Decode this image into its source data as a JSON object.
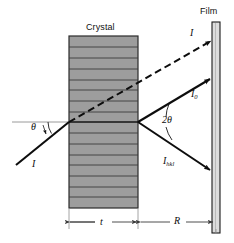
{
  "figure": {
    "type": "x-ray-diffraction-schematic",
    "labels": {
      "crystal": "Crystal",
      "film": "Film",
      "incident_beam": "I",
      "transmitted_beam": "I",
      "direct_beam": "I",
      "direct_beam_sub": "0",
      "diffracted_beam": "I",
      "diffracted_beam_sub": "hkl",
      "theta": "θ",
      "two_theta": "2θ",
      "thickness": "t",
      "distance": "R"
    },
    "colors": {
      "crystal_fill": "#9d9d9d",
      "crystal_stroke": "#2b2b2b",
      "crystal_line": "#3a3a3a",
      "film_fill": "#dcdcdc",
      "film_stroke": "#1a1a1a",
      "beam": "#0d0d0d",
      "reference_line": "#8c8c8c",
      "dimension_line": "#4a4a4a",
      "background": "#ffffff"
    },
    "geometry": {
      "crystal": {
        "x": 69,
        "y": 36,
        "width": 69,
        "height": 172,
        "lattice_lines": 16
      },
      "film": {
        "x": 212,
        "y": 22,
        "width": 8,
        "height": 211
      },
      "scatter_point": {
        "x": 138,
        "y": 122
      },
      "entry_point": {
        "x": 69,
        "y": 122
      },
      "incident_start": {
        "x": 16,
        "y": 165
      },
      "transmitted_end": {
        "x": 213,
        "y": 41
      },
      "direct_end": {
        "x": 213,
        "y": 78
      },
      "diffracted_end": {
        "x": 213,
        "y": 172
      },
      "reference_line": {
        "x1": 12,
        "x2": 138,
        "y": 122
      },
      "dim_t": {
        "x1": 69,
        "x2": 138,
        "y": 222
      },
      "dim_R": {
        "x1": 139,
        "x2": 214,
        "y": 222
      }
    }
  }
}
